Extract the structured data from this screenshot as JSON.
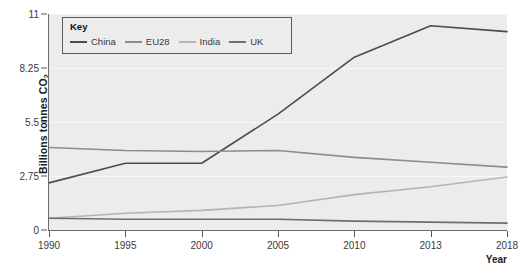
{
  "chart_data": {
    "type": "line",
    "title": "",
    "xlabel": "Year",
    "ylabel": "Billions tonnes CO2",
    "ylabel_main": "Billions tonnes CO",
    "ylabel_sub": "2",
    "x": [
      1990,
      1995,
      2000,
      2005,
      2010,
      2013,
      2018
    ],
    "xtick_labels": [
      "1990",
      "1995",
      "2000",
      "2005",
      "2010",
      "2013",
      "2018"
    ],
    "ytick_labels": [
      "0",
      "2.75",
      "5.5",
      "8.25",
      "11"
    ],
    "ytick_values": [
      0,
      2.75,
      5.5,
      8.25,
      11
    ],
    "ylim": [
      0,
      11
    ],
    "xlim": [
      1990,
      2018
    ],
    "grid": true,
    "legend_position": "top-left",
    "legend_title": "Key",
    "series": [
      {
        "name": "China",
        "color": "#4c4c4c",
        "values": [
          2.4,
          3.4,
          3.4,
          5.9,
          8.8,
          10.4,
          10.1
        ]
      },
      {
        "name": "EU28",
        "color": "#8c8c8c",
        "values": [
          4.2,
          4.05,
          4.0,
          4.05,
          3.7,
          3.45,
          3.2
        ]
      },
      {
        "name": "India",
        "color": "#b4b4b4",
        "values": [
          0.6,
          0.85,
          1.0,
          1.25,
          1.8,
          2.2,
          2.7
        ]
      },
      {
        "name": "UK",
        "color": "#6e6e6e",
        "values": [
          0.6,
          0.55,
          0.55,
          0.55,
          0.45,
          0.4,
          0.35
        ]
      }
    ]
  }
}
